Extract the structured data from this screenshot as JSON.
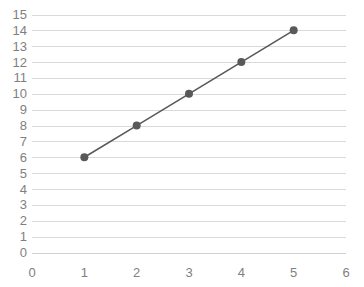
{
  "chart_data": {
    "type": "line",
    "title": "",
    "subtitle": "",
    "xlabel": "",
    "ylabel": "",
    "xlim": [
      0,
      6
    ],
    "ylim": [
      0,
      15
    ],
    "x": [
      1,
      2,
      3,
      4,
      5
    ],
    "values": [
      6,
      8,
      10,
      12,
      14
    ],
    "series": [
      {
        "name": "Series 1",
        "x": [
          1,
          2,
          3,
          4,
          5
        ],
        "values": [
          6,
          8,
          10,
          12,
          14
        ]
      }
    ],
    "x_tick_labels": [
      "0",
      "1",
      "2",
      "3",
      "4",
      "5",
      "6"
    ],
    "x_ticks": [
      0,
      1,
      2,
      3,
      4,
      5,
      6
    ],
    "y_tick_labels": [
      "0",
      "1",
      "2",
      "3",
      "4",
      "5",
      "6",
      "7",
      "8",
      "9",
      "10",
      "11",
      "12",
      "13",
      "14",
      "15"
    ],
    "y_ticks": [
      0,
      1,
      2,
      3,
      4,
      5,
      6,
      7,
      8,
      9,
      10,
      11,
      12,
      13,
      14,
      15
    ],
    "grid": {
      "horizontal": true,
      "vertical": false
    },
    "legend": {
      "visible": false,
      "position": "none",
      "entries": []
    },
    "annotations": [],
    "markers": {
      "shape": "circle",
      "visible": true
    },
    "colors": {
      "line": "#595959",
      "marker": "#595959",
      "gridline": "#d9d9d9",
      "axis": "#d0d0d0",
      "tick_label": "#7f7f7f",
      "background": "#ffffff"
    }
  }
}
